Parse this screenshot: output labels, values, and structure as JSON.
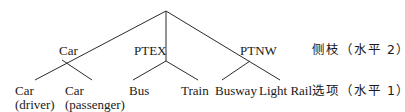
{
  "diagram": {
    "type": "nested-logit-tree",
    "root": {
      "x": 166,
      "y": 11
    },
    "nests": [
      {
        "id": "car",
        "label": "Car",
        "x": 62,
        "y": 60
      },
      {
        "id": "ptex",
        "label": "PTEX",
        "x": 166,
        "y": 61
      },
      {
        "id": "ptnw",
        "label": "PTNW",
        "x": 250,
        "y": 61
      }
    ],
    "leaves": [
      {
        "id": "car-driver",
        "line1": "Car",
        "line2": "(driver)",
        "nest": "car"
      },
      {
        "id": "car-passenger",
        "line1": "Car",
        "line2": "(passenger)",
        "nest": "car"
      },
      {
        "id": "bus",
        "line1": "Bus",
        "line2": "",
        "nest": "ptex"
      },
      {
        "id": "train",
        "line1": "Train",
        "line2": "",
        "nest": "ptex"
      },
      {
        "id": "busway",
        "line1": "Busway",
        "line2": "",
        "nest": "ptnw"
      },
      {
        "id": "light-rail",
        "line1": "Light Rail",
        "line2": "",
        "nest": "ptnw"
      }
    ],
    "level_labels": {
      "level2": "侧枝（水平 2）",
      "level1": "选项（水平 1）"
    },
    "colors": {
      "line": "#2a2a2a",
      "text": "#1a1a1a",
      "background": "#ffffff"
    }
  }
}
